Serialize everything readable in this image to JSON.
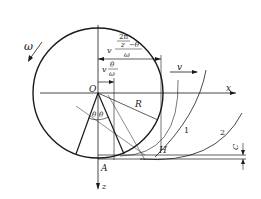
{
  "diagram": {
    "type": "rolling-cutter geometry",
    "labels": {
      "omega": "ω",
      "v_top": "v",
      "v_label_long_prefix": "v",
      "v_label_long_num": "2π/z − θ",
      "v_label_long_num_a": "2π",
      "v_label_long_num_b": "z",
      "v_label_long_num_c": "−θ",
      "v_label_long_den": "ω",
      "v_label_short_prefix": "v",
      "v_label_short_num": "θ",
      "v_label_short_den": "ω",
      "origin": "O",
      "x_axis": "x",
      "z_axis": "z",
      "radius": "R",
      "theta_left": "θ",
      "theta_right": "θ",
      "point_A": "A",
      "point_H": "H",
      "curve_1": "1",
      "curve_2": "2",
      "clearance": "C"
    },
    "colors": {
      "line": "#1a1a1a",
      "background": "#ffffff"
    }
  }
}
